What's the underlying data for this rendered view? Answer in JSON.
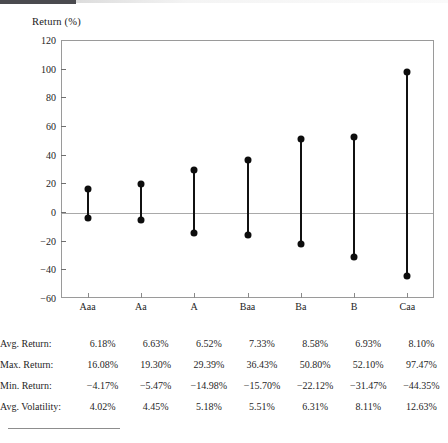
{
  "chart_data": {
    "type": "bar",
    "subtype": "range-bar-high-low",
    "title": "",
    "xlabel": "",
    "ylabel": "Return (%)",
    "ylim": [
      -60,
      120
    ],
    "yticks": [
      120,
      100,
      80,
      60,
      40,
      20,
      0,
      -20,
      -40,
      -60
    ],
    "ytick_labels": [
      "120",
      "100",
      "80",
      "60",
      "40",
      "20",
      "0",
      "−20",
      "−40",
      "−60"
    ],
    "grid": false,
    "zero_line": true,
    "legend": "none",
    "categories": [
      "Aaa",
      "Aa",
      "A",
      "Baa",
      "Ba",
      "B",
      "Caa"
    ],
    "series": [
      {
        "name": "Max. Return",
        "values": [
          16.08,
          19.3,
          29.39,
          36.43,
          50.8,
          52.1,
          97.47
        ]
      },
      {
        "name": "Min. Return",
        "values": [
          -4.17,
          -5.47,
          -14.98,
          -15.7,
          -22.12,
          -31.47,
          -44.35
        ]
      },
      {
        "name": "Avg. Return",
        "values": [
          6.18,
          6.63,
          6.52,
          7.33,
          8.58,
          6.93,
          8.1
        ]
      },
      {
        "name": "Avg. Volatility",
        "values": [
          4.02,
          4.45,
          5.18,
          5.51,
          6.31,
          8.11,
          12.63
        ]
      }
    ]
  },
  "table": {
    "rows": [
      {
        "label": "Avg. Return:",
        "values": [
          "6.18%",
          "6.63%",
          "6.52%",
          "7.33%",
          "8.58%",
          "6.93%",
          "8.10%"
        ]
      },
      {
        "label": "Max. Return:",
        "values": [
          "16.08%",
          "19.30%",
          "29.39%",
          "36.43%",
          "50.80%",
          "52.10%",
          "97.47%"
        ]
      },
      {
        "label": "Min. Return:",
        "values": [
          "−4.17%",
          "−5.47%",
          "−14.98%",
          "−15.70%",
          "−22.12%",
          "−31.47%",
          "−44.35%"
        ]
      },
      {
        "label": "Avg. Volatility:",
        "values": [
          "4.02%",
          "4.45%",
          "5.18%",
          "5.51%",
          "6.31%",
          "8.11%",
          "12.63%"
        ]
      }
    ]
  },
  "colors": {
    "marker": "#0d0d0d",
    "axis": "#9a9a9a",
    "text": "#1f1f1f"
  }
}
